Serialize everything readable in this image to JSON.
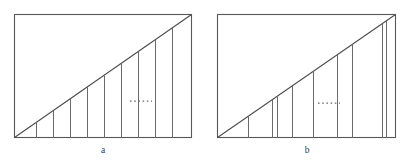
{
  "figure": {
    "caption_a": "a",
    "caption_b": "b",
    "stroke_color": "#58585a",
    "line_color": "#6a6a6c",
    "diagonal_color": "#4a4a4c",
    "background_color": "#ffffff"
  },
  "chart_data": {
    "type": "line",
    "title": "",
    "xlabel": "",
    "ylabel": "",
    "panels": [
      {
        "id": "a",
        "label": "a",
        "label_x": 103,
        "label_y": 153,
        "box": {
          "x": 14,
          "y": 14,
          "width": 178,
          "height": 124
        },
        "diagonal": {
          "x1": 14,
          "y1": 138,
          "x2": 192,
          "y2": 14
        },
        "partition_type": "uniform",
        "partition_count": 9,
        "partition_x": [
          36,
          53,
          70,
          87,
          104,
          121,
          138,
          155,
          172
        ],
        "partition_widths": [
          17,
          17,
          17,
          17,
          17,
          17,
          17,
          17,
          17
        ],
        "ellipsis": {
          "x1": 130,
          "x2": 152,
          "y": 101
        }
      },
      {
        "id": "b",
        "label": "b",
        "label_x": 307,
        "label_y": 153,
        "box": {
          "x": 217,
          "y": 14,
          "width": 179,
          "height": 124
        },
        "diagonal": {
          "x1": 217,
          "y1": 138,
          "x2": 396,
          "y2": 14
        },
        "partition_type": "non-uniform",
        "partition_count": 9,
        "partition_x": [
          248,
          272,
          277,
          292,
          313,
          337,
          352,
          382,
          386
        ],
        "partition_widths": [
          31,
          24,
          5,
          15,
          21,
          24,
          15,
          30,
          4
        ],
        "ellipsis": {
          "x1": 318,
          "x2": 340,
          "y": 103
        }
      }
    ],
    "xlim": [
      0,
      418
    ],
    "ylim": [
      0,
      163
    ],
    "grid": false,
    "legend": null
  }
}
